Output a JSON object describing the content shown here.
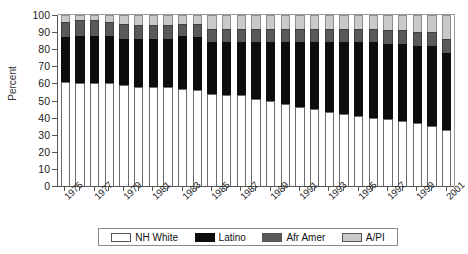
{
  "chart_data": {
    "type": "bar",
    "stacked": true,
    "title": "",
    "xlabel": "",
    "ylabel": "Percent",
    "ylim": [
      0,
      100
    ],
    "ytick_step": 10,
    "yticks": [
      0,
      10,
      20,
      30,
      40,
      50,
      60,
      70,
      80,
      90,
      100
    ],
    "grid": false,
    "legend_position": "bottom",
    "x": [
      1975,
      1976,
      1977,
      1978,
      1979,
      1980,
      1981,
      1982,
      1983,
      1984,
      1985,
      1986,
      1987,
      1988,
      1989,
      1990,
      1991,
      1992,
      1993,
      1994,
      1995,
      1996,
      1997,
      1998,
      1999,
      2000,
      2001
    ],
    "xtick_labels": [
      "1975",
      "1977",
      "1979",
      "1981",
      "1983",
      "1985",
      "1987",
      "1989",
      "1991",
      "1993",
      "1995",
      "1997",
      "1999",
      "2001"
    ],
    "xtick_values": [
      1975,
      1977,
      1979,
      1981,
      1983,
      1985,
      1987,
      1989,
      1991,
      1993,
      1995,
      1997,
      1999,
      2001
    ],
    "series": [
      {
        "name": "NH White",
        "color": "#ffffff",
        "values": [
          61,
          60,
          60,
          60,
          59,
          58,
          58,
          58,
          57,
          56,
          54,
          53,
          53,
          51,
          50,
          48,
          46,
          45,
          43,
          42,
          41,
          40,
          39,
          38,
          37,
          35,
          33
        ]
      },
      {
        "name": "Latino",
        "color": "#0d0d0d",
        "values": [
          26,
          28,
          28,
          28,
          27,
          28,
          28,
          28,
          31,
          31,
          30,
          31,
          31,
          33,
          34,
          36,
          38,
          39,
          41,
          42,
          43,
          44,
          44,
          45,
          45,
          47,
          45
        ]
      },
      {
        "name": "Afr Amer",
        "color": "#595959",
        "values": [
          9,
          9,
          9,
          8,
          9,
          8,
          8,
          8,
          7,
          8,
          8,
          8,
          8,
          8,
          8,
          8,
          8,
          8,
          8,
          8,
          8,
          8,
          8,
          8,
          8,
          8,
          8
        ]
      },
      {
        "name": "A/PI",
        "color": "#c9c9c9",
        "values": [
          4,
          3,
          3,
          4,
          5,
          6,
          6,
          6,
          5,
          5,
          8,
          8,
          8,
          8,
          8,
          8,
          8,
          8,
          8,
          8,
          8,
          8,
          9,
          9,
          10,
          10,
          14
        ]
      }
    ]
  },
  "legend": {
    "items": [
      {
        "label": "NH White",
        "swatch": "white"
      },
      {
        "label": "Latino",
        "swatch": "black"
      },
      {
        "label": "Afr Amer",
        "swatch": "dgray"
      },
      {
        "label": "A/PI",
        "swatch": "lgray"
      }
    ]
  },
  "axes": {
    "y_title": "Percent"
  }
}
